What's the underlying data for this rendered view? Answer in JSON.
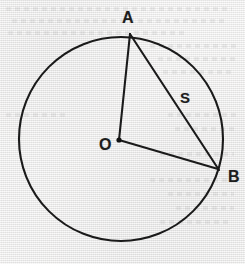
{
  "figure": {
    "kind": "geometry-diagram",
    "background_color": "#eeeeee",
    "ink_color": "#1a1a1a"
  },
  "labels": {
    "point_a": "A",
    "point_b": "B",
    "center_o": "O",
    "chord_s": "S"
  },
  "geometry": {
    "circle": {
      "cx": 121,
      "cy": 139,
      "r": 102,
      "stroke_width": 2.1
    },
    "center_dot": {
      "cx": 119,
      "cy": 140,
      "r": 2.6
    },
    "points": {
      "A": {
        "x": 130,
        "y": 33
      },
      "B": {
        "x": 218,
        "y": 169
      },
      "O": {
        "x": 119,
        "y": 140
      }
    },
    "segments": [
      {
        "name": "radius-OA",
        "from": "O",
        "to": "A"
      },
      {
        "name": "radius-OB",
        "from": "O",
        "to": "B"
      },
      {
        "name": "chord-AB",
        "from": "A",
        "to": "B",
        "label": "S"
      }
    ]
  },
  "label_positions": {
    "A": {
      "x": 122,
      "y": 10
    },
    "B": {
      "x": 228,
      "y": 169
    },
    "O": {
      "x": 99,
      "y": 137
    },
    "S": {
      "x": 180,
      "y": 90
    }
  },
  "bleed_lines": [
    {
      "x": 6,
      "y": 7,
      "w": 226
    },
    {
      "x": 12,
      "y": 19,
      "w": 215
    },
    {
      "x": 8,
      "y": 31,
      "w": 180
    },
    {
      "x": 150,
      "y": 44,
      "w": 86
    },
    {
      "x": 158,
      "y": 57,
      "w": 78
    },
    {
      "x": 163,
      "y": 70,
      "w": 72
    },
    {
      "x": 6,
      "y": 113,
      "w": 62
    },
    {
      "x": 168,
      "y": 113,
      "w": 68
    },
    {
      "x": 175,
      "y": 127,
      "w": 60
    },
    {
      "x": 160,
      "y": 152,
      "w": 74
    },
    {
      "x": 150,
      "y": 178,
      "w": 84
    },
    {
      "x": 168,
      "y": 192,
      "w": 66
    },
    {
      "x": 176,
      "y": 206,
      "w": 58
    },
    {
      "x": 160,
      "y": 220,
      "w": 72
    }
  ]
}
